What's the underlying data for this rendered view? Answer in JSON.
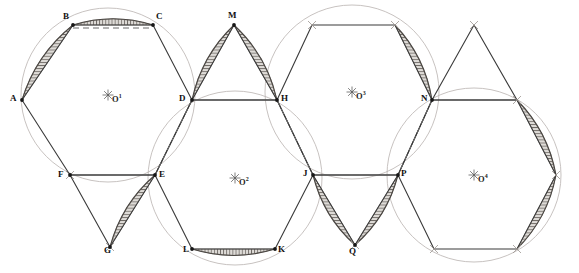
{
  "figure": {
    "type": "geometric-construction",
    "width": 579,
    "height": 273,
    "background": "#ffffff",
    "stroke_dark": "#3a3a3a",
    "stroke_light": "#b9b3b0",
    "stroke_dashed": "#6b6b6b",
    "hatch_color": "#7a7570",
    "hatch_fill": "#d9d6d2"
  },
  "centers": [
    {
      "id": "O1",
      "label": "O",
      "sup": "1",
      "x": 108,
      "y": 95
    },
    {
      "id": "O2",
      "label": "O",
      "sup": "2",
      "x": 235,
      "y": 178
    },
    {
      "id": "O3",
      "label": "O",
      "sup": "3",
      "x": 352,
      "y": 92
    },
    {
      "id": "O4",
      "label": "O",
      "sup": "4",
      "x": 474,
      "y": 175
    }
  ],
  "vertices": [
    {
      "id": "A",
      "label": "A",
      "x": 22,
      "y": 100,
      "lx": 10,
      "ly": 94
    },
    {
      "id": "B",
      "label": "B",
      "x": 73,
      "y": 25,
      "lx": 63,
      "ly": 12
    },
    {
      "id": "C",
      "label": "C",
      "x": 153,
      "y": 25,
      "lx": 156,
      "ly": 12
    },
    {
      "id": "D",
      "label": "D",
      "x": 192,
      "y": 100,
      "lx": 179,
      "ly": 94
    },
    {
      "id": "E",
      "label": "E",
      "x": 155,
      "y": 175,
      "lx": 159,
      "ly": 170
    },
    {
      "id": "F",
      "label": "F",
      "x": 70,
      "y": 175,
      "lx": 58,
      "ly": 170
    },
    {
      "id": "G",
      "label": "G",
      "x": 110,
      "y": 247,
      "lx": 104,
      "ly": 246
    },
    {
      "id": "H",
      "label": "H",
      "x": 277,
      "y": 100,
      "lx": 281,
      "ly": 94
    },
    {
      "id": "J",
      "label": "J",
      "x": 313,
      "y": 175,
      "lx": 303,
      "ly": 169
    },
    {
      "id": "K",
      "label": "K",
      "x": 275,
      "y": 249,
      "lx": 278,
      "ly": 245
    },
    {
      "id": "L",
      "label": "L",
      "x": 192,
      "y": 249,
      "lx": 183,
      "ly": 245
    },
    {
      "id": "M",
      "label": "M",
      "x": 234,
      "y": 25,
      "lx": 228,
      "ly": 11
    },
    {
      "id": "N",
      "label": "N",
      "x": 432,
      "y": 100,
      "lx": 421,
      "ly": 94
    },
    {
      "id": "P",
      "label": "P",
      "x": 398,
      "y": 175,
      "lx": 401,
      "ly": 169
    },
    {
      "id": "Q",
      "label": "Q",
      "x": 355,
      "y": 245,
      "lx": 349,
      "ly": 247
    }
  ],
  "circles": [
    {
      "id": "circle-O1",
      "cx": 108,
      "cy": 95,
      "r": 87
    },
    {
      "id": "circle-O2",
      "cx": 235,
      "cy": 178,
      "r": 87
    },
    {
      "id": "circle-O3",
      "cx": 352,
      "cy": 92,
      "r": 87
    },
    {
      "id": "circle-O4",
      "cx": 474,
      "cy": 175,
      "r": 87
    }
  ],
  "dashed_chords": [
    {
      "id": "chord-BC",
      "x1": 73,
      "y1": 28,
      "x2": 153,
      "y2": 28
    },
    {
      "id": "chord-FE",
      "x1": 70,
      "y1": 175,
      "x2": 155,
      "y2": 175
    },
    {
      "id": "chord-DH",
      "x1": 192,
      "y1": 100,
      "x2": 277,
      "y2": 100
    },
    {
      "id": "chord-JP",
      "x1": 313,
      "y1": 175,
      "x2": 398,
      "y2": 175
    },
    {
      "id": "chord-NR",
      "x1": 432,
      "y1": 100,
      "x2": 517,
      "y2": 100
    },
    {
      "id": "chord-DE",
      "x1": 192,
      "y1": 100,
      "x2": 155,
      "y2": 175
    },
    {
      "id": "chord-HJ",
      "x1": 277,
      "y1": 100,
      "x2": 313,
      "y2": 175
    },
    {
      "id": "chord-NP",
      "x1": 432,
      "y1": 100,
      "x2": 398,
      "y2": 175
    }
  ],
  "polygons": {
    "hex1": [
      [
        22,
        100
      ],
      [
        73,
        25
      ],
      [
        153,
        25
      ],
      [
        192,
        100
      ],
      [
        155,
        175
      ],
      [
        70,
        175
      ]
    ],
    "hex2": [
      [
        192,
        100
      ],
      [
        155,
        175
      ],
      [
        192,
        249
      ],
      [
        275,
        249
      ],
      [
        313,
        175
      ],
      [
        277,
        100
      ]
    ],
    "hex3": [
      [
        277,
        100
      ],
      [
        313,
        175
      ],
      [
        398,
        175
      ],
      [
        432,
        100
      ],
      [
        395,
        25
      ],
      [
        312,
        25
      ]
    ],
    "hex4": [
      [
        432,
        100
      ],
      [
        398,
        175
      ],
      [
        434,
        249
      ],
      [
        517,
        249
      ],
      [
        556,
        175
      ],
      [
        517,
        100
      ]
    ],
    "tri_M": [
      [
        192,
        100
      ],
      [
        234,
        25
      ],
      [
        277,
        100
      ]
    ],
    "tri_G": [
      [
        70,
        175
      ],
      [
        110,
        247
      ],
      [
        155,
        175
      ]
    ],
    "tri_Q": [
      [
        313,
        175
      ],
      [
        355,
        245
      ],
      [
        398,
        175
      ]
    ],
    "tri_R": [
      [
        432,
        100
      ],
      [
        474,
        25
      ],
      [
        517,
        100
      ]
    ]
  },
  "hatched_lunes": [
    {
      "id": "lune-AB",
      "p1": [
        22,
        100
      ],
      "p2": [
        73,
        25
      ],
      "cx": 108,
      "cy": 95,
      "r": 87,
      "side": 1
    },
    {
      "id": "lune-BC",
      "p1": [
        73,
        25
      ],
      "p2": [
        153,
        25
      ],
      "cx": 108,
      "cy": 95,
      "r": 87,
      "side": 1
    },
    {
      "id": "lune-EG",
      "p1": [
        155,
        175
      ],
      "p2": [
        110,
        247
      ],
      "cx": 235,
      "cy": 178,
      "r": 87,
      "side": -1
    },
    {
      "id": "lune-DM",
      "p1": [
        192,
        100
      ],
      "p2": [
        234,
        25
      ],
      "cx": 235,
      "cy": 178,
      "r": 87,
      "side": 1
    },
    {
      "id": "lune-MH",
      "p1": [
        234,
        25
      ],
      "p2": [
        277,
        100
      ],
      "cx": 235,
      "cy": 178,
      "r": 87,
      "side": 1
    },
    {
      "id": "lune-LK",
      "p1": [
        192,
        249
      ],
      "p2": [
        275,
        249
      ],
      "cx": 235,
      "cy": 178,
      "r": 87,
      "side": -1
    },
    {
      "id": "lune-JQ",
      "p1": [
        313,
        175
      ],
      "p2": [
        355,
        245
      ],
      "cx": 352,
      "cy": 92,
      "r": 87,
      "side": -1
    },
    {
      "id": "lune-QP",
      "p1": [
        355,
        245
      ],
      "p2": [
        398,
        175
      ],
      "cx": 352,
      "cy": 92,
      "r": 87,
      "side": -1
    },
    {
      "id": "lune-CN",
      "p1": [
        395,
        25
      ],
      "p2": [
        432,
        100
      ],
      "cx": 352,
      "cy": 92,
      "r": 87,
      "side": 1
    },
    {
      "id": "lune-RS",
      "p1": [
        517,
        100
      ],
      "p2": [
        556,
        175
      ],
      "cx": 474,
      "cy": 175,
      "r": 87,
      "side": 1
    },
    {
      "id": "lune-SP",
      "p1": [
        556,
        175
      ],
      "p2": [
        517,
        249
      ],
      "cx": 474,
      "cy": 175,
      "r": 87,
      "side": 1
    }
  ],
  "tick_marks": [
    {
      "x": 312,
      "y": 25
    },
    {
      "x": 395,
      "y": 25
    },
    {
      "x": 474,
      "y": 25
    },
    {
      "x": 517,
      "y": 100
    },
    {
      "x": 434,
      "y": 249
    },
    {
      "x": 517,
      "y": 249
    },
    {
      "x": 556,
      "y": 175
    },
    {
      "x": 110,
      "y": 247
    },
    {
      "x": 70,
      "y": 175
    },
    {
      "x": 355,
      "y": 245
    }
  ]
}
